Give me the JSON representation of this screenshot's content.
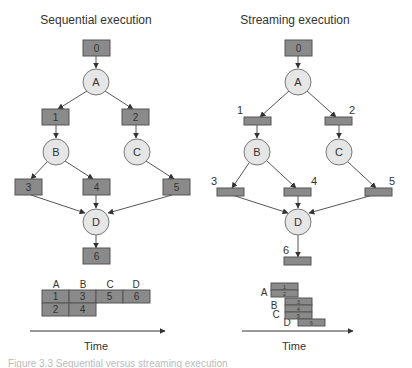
{
  "colors": {
    "box_fill": "#8a8a8a",
    "box_stroke": "#555555",
    "circle_fill": "#e6e6e6",
    "circle_stroke": "#777777",
    "edge": "#555555",
    "text": "#333333"
  },
  "sequential": {
    "title": "Sequential execution",
    "boxes": [
      "0",
      "1",
      "2",
      "3",
      "4",
      "5",
      "6"
    ],
    "stages": [
      "A",
      "B",
      "C",
      "D"
    ],
    "gantt": {
      "columns": [
        "A",
        "B",
        "C",
        "D"
      ],
      "rows": [
        [
          "1",
          "3",
          "5",
          "6"
        ],
        [
          "2",
          "4"
        ]
      ]
    },
    "axis_label": "Time"
  },
  "streaming": {
    "title": "Streaming execution",
    "boxes": [
      "0",
      "1",
      "2",
      "3",
      "4",
      "5",
      "6"
    ],
    "stages": [
      "A",
      "B",
      "C",
      "D"
    ],
    "gantt": {
      "stage_labels": [
        "A",
        "B",
        "C",
        "D"
      ],
      "bars": [
        "1",
        "2",
        "3",
        "4",
        "5",
        "6"
      ]
    },
    "axis_label": "Time"
  },
  "caption": "Figure 3.3   Sequential versus streaming execution"
}
